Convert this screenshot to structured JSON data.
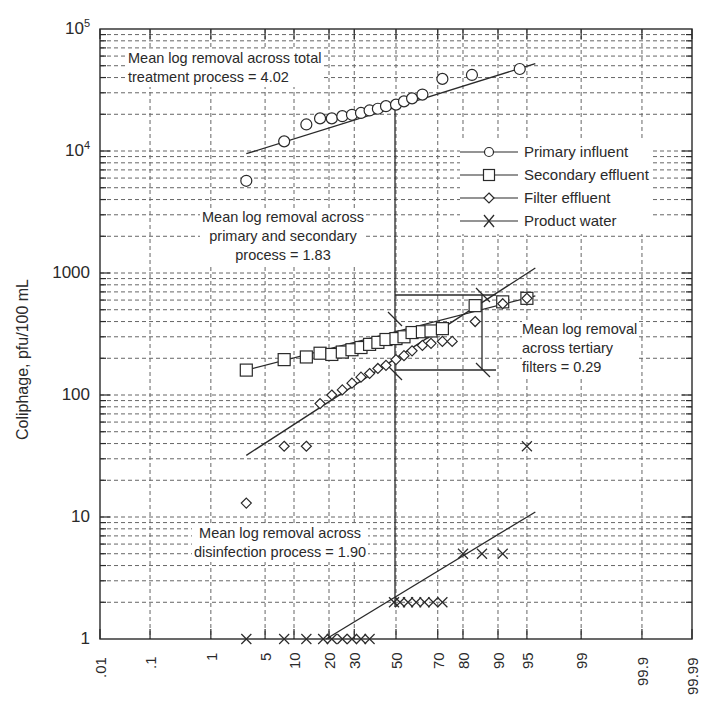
{
  "chart_data": {
    "type": "scatter",
    "title": "",
    "xlabel": "",
    "ylabel": "Coliphage, pfu/100 mL",
    "y_scale": "log",
    "x_scale": "probability",
    "ylim": [
      1,
      100000
    ],
    "xlim": [
      0.01,
      99.99
    ],
    "grid": true,
    "legend_position": "upper right (inside plot)",
    "y_ticks": [
      "1",
      "10",
      "100",
      "1000",
      "10^4",
      "10^5"
    ],
    "x_ticks": [
      ".01",
      ".1",
      "1",
      "5",
      "10",
      "20",
      "30",
      "50",
      "70",
      "80",
      "90",
      "95",
      "99",
      "99.9",
      "99.99"
    ],
    "legend": [
      "Primary influent",
      "Secondary effluent",
      "Filter effluent",
      "Product water"
    ],
    "series": [
      {
        "name": "Primary influent",
        "marker": "circle",
        "x": [
          3,
          8,
          13,
          17,
          21,
          25,
          29,
          33,
          37,
          41,
          45,
          50,
          54,
          58,
          63,
          72,
          83,
          94
        ],
        "y": [
          5700,
          12000,
          16500,
          18500,
          18500,
          19300,
          19800,
          20500,
          21500,
          22200,
          23300,
          24000,
          25500,
          27000,
          29000,
          39000,
          42000,
          47000
        ],
        "fit_line": {
          "x": [
            3,
            96
          ],
          "y": [
            9500,
            52000
          ]
        }
      },
      {
        "name": "Secondary effluent",
        "marker": "square",
        "x": [
          3,
          8,
          13,
          17,
          21,
          25,
          29,
          33,
          37,
          41,
          45,
          50,
          54,
          58,
          63,
          67,
          72,
          84,
          91,
          95
        ],
        "y": [
          160,
          195,
          205,
          220,
          215,
          225,
          235,
          245,
          260,
          270,
          285,
          290,
          300,
          325,
          330,
          335,
          350,
          540,
          580,
          620
        ],
        "fit_line": {
          "x": [
            3,
            96
          ],
          "y": [
            160,
            650
          ]
        }
      },
      {
        "name": "Filter effluent",
        "marker": "diamond",
        "x": [
          3,
          8,
          13,
          17,
          21,
          25,
          29,
          33,
          37,
          41,
          45,
          50,
          54,
          58,
          63,
          67,
          72,
          76,
          84,
          91,
          95
        ],
        "y": [
          13,
          38,
          38,
          85,
          100,
          110,
          125,
          140,
          150,
          165,
          175,
          195,
          210,
          230,
          255,
          265,
          275,
          275,
          400,
          560,
          620
        ],
        "fit_line": {
          "x": [
            3,
            96
          ],
          "y": [
            32,
            1100
          ]
        }
      },
      {
        "name": "Product water",
        "marker": "x",
        "x": [
          3,
          8,
          13,
          18,
          21,
          25,
          29,
          33,
          37,
          49,
          52,
          56,
          60,
          64,
          68,
          72,
          80,
          86,
          91,
          95
        ],
        "y": [
          1,
          1,
          1,
          1,
          1,
          1,
          1,
          1,
          1,
          2,
          2,
          2,
          2,
          2,
          2,
          2,
          5,
          5,
          5,
          38
        ],
        "fit_line": {
          "x": [
            19,
            96
          ],
          "y": [
            1,
            11
          ]
        }
      }
    ],
    "annotations": [
      {
        "text": "Mean log removal across total treatment process = 4.02"
      },
      {
        "text": "Mean log removal across primary and secondary process = 1.83"
      },
      {
        "text": "Mean log removal across tertiary filters = 0.29"
      },
      {
        "text": "Mean log removal across disinfection process = 1.90"
      }
    ]
  },
  "labels": {
    "y_axis_title": "Coliphage, pfu/100 mL",
    "y_ticks": {
      "t1": "1",
      "t10": "10",
      "t100": "100",
      "t1000": "1000",
      "t1e4_base": "10",
      "t1e4_exp": "4",
      "t1e5_base": "10",
      "t1e5_exp": "5"
    },
    "x_ticks": [
      ".01",
      ".1",
      "1",
      "5",
      "10",
      "20",
      "30",
      "50",
      "70",
      "80",
      "90",
      "95",
      "99",
      "99.9",
      "99.99"
    ],
    "ann_total_1": "Mean log removal across total",
    "ann_total_2": "treatment process = 4.02",
    "ann_ps_1": "Mean log removal across",
    "ann_ps_2": "primary and secondary",
    "ann_ps_3": "process = 1.83",
    "ann_tert_1": "Mean log removal",
    "ann_tert_2": "across tertiary",
    "ann_tert_3": "filters = 0.29",
    "ann_dis_1": "Mean log removal across",
    "ann_dis_2": "disinfection process = 1.90",
    "legend": {
      "primary": "Primary influent",
      "secondary": "Secondary effluent",
      "filter": "Filter effluent",
      "product": "Product water"
    }
  },
  "colors": {
    "ink": "#2a2a2a",
    "grid": "#555555",
    "background": "#ffffff"
  }
}
